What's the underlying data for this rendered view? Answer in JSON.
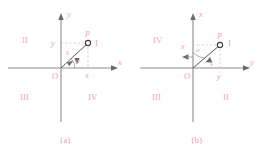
{
  "figure": {
    "title": ""
  },
  "panels": [
    {
      "id": "a",
      "caption": "(a)",
      "origin_label": "O",
      "vertical_axis_label": "y",
      "horizontal_axis_label": "x",
      "point_label": "P",
      "radius_label": "s",
      "angle_label": "α",
      "ordinate_label": "y",
      "abscissa_label": "x",
      "quadrants": [
        {
          "name": "I",
          "position": "top-right"
        },
        {
          "name": "II",
          "position": "top-left"
        },
        {
          "name": "III",
          "position": "bottom-left"
        },
        {
          "name": "IV",
          "position": "bottom-right"
        }
      ]
    },
    {
      "id": "b",
      "caption": "(b)",
      "origin_label": "O",
      "vertical_axis_label": "x",
      "horizontal_axis_label": "y",
      "point_label": "P",
      "radius_label": "s",
      "angle_label": "α",
      "ordinate_label": "x",
      "abscissa_label": "y",
      "quadrants": [
        {
          "name": "I",
          "position": "top-right"
        },
        {
          "name": "IV",
          "position": "top-left"
        },
        {
          "name": "III",
          "position": "bottom-left"
        },
        {
          "name": "II",
          "position": "bottom-right"
        }
      ]
    }
  ],
  "colors": {
    "label_pink": "#f0a0aa",
    "axis_gray": "#8b8b8b",
    "ray_dark": "#5a5a5a",
    "background": "#ffffff"
  }
}
